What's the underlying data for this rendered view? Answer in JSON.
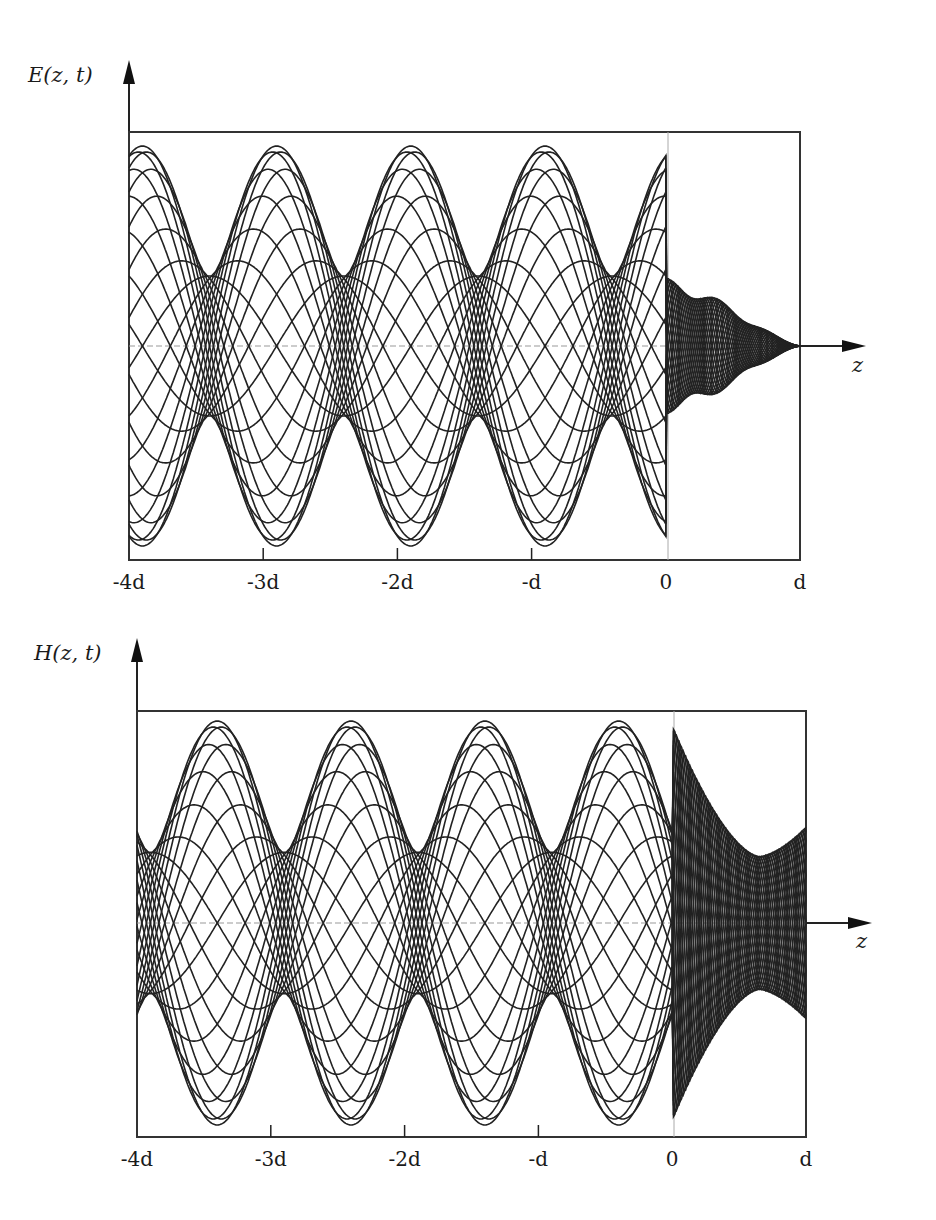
{
  "chart_data": [
    {
      "type": "line",
      "title": "",
      "ylabel": "E(z, t)",
      "xlabel": "z",
      "x_tick_labels": [
        "-4d",
        "-3d",
        "-2d",
        "-d",
        "0",
        "d"
      ],
      "x_range": [
        -4,
        1
      ],
      "grid": false,
      "description": "Family of snapshots of the electric field E(z,t) at many times; partial standing wave for z<0 with envelope maxima near -3d and -d, minima near -2d and -4d; inside slab 0<z<d field decays to zero at z=d.",
      "envelope": {
        "region_z_lt_0": {
          "max_amplitude": 1.0,
          "min_amplitude": 0.35,
          "maxima_at": [
            -2.9,
            -0.9
          ],
          "minima_at": [
            -3.9,
            -1.9
          ]
        },
        "region_0_to_d": {
          "amplitude_at_0": 0.28,
          "bulge_amplitude": 0.2,
          "value_at_d": 0.0
        }
      },
      "num_snapshots": 24
    },
    {
      "type": "line",
      "title": "",
      "ylabel": "H(z, t)",
      "xlabel": "z",
      "x_tick_labels": [
        "-4d",
        "-3d",
        "-2d",
        "-d",
        "0",
        "d"
      ],
      "x_range": [
        -4,
        1
      ],
      "grid": false,
      "description": "Family of snapshots of the magnetic field H(z,t); envelope maxima near -4d, -2d and at 0 (cusp), minima near -2.9d and -0.9d; inside slab a minimum near 0.65d then rising to d.",
      "envelope": {
        "region_z_lt_0": {
          "max_amplitude": 1.0,
          "min_amplitude": 0.35,
          "maxima_at": [
            -3.9,
            -1.9,
            0.0
          ],
          "minima_at": [
            -2.9,
            -0.9
          ]
        },
        "region_0_to_d": {
          "amplitude_at_0": 0.98,
          "min_amplitude": 0.33,
          "min_at": 0.65,
          "amplitude_at_d": 0.45
        }
      },
      "num_snapshots": 24
    }
  ],
  "plots": {
    "top": {
      "ylabel": "E(z, t)",
      "xlabel": "z",
      "ticks": [
        "-4d",
        "-3d",
        "-2d",
        "-d",
        "0",
        "d"
      ]
    },
    "bottom": {
      "ylabel": "H(z, t)",
      "xlabel": "z",
      "ticks": [
        "-4d",
        "-3d",
        "-2d",
        "-d",
        "0",
        "d"
      ]
    }
  },
  "colors": {
    "curve": "#222222",
    "frame": "#333333",
    "axis_dash": "#999999"
  }
}
